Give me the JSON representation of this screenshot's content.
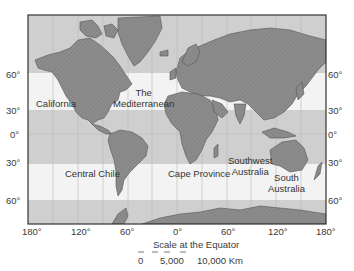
{
  "map": {
    "type": "world-map-equirectangular",
    "colors": {
      "land": "#8c8c8c",
      "land_hatch": "#7a7a7a",
      "shaded_band": "#cfcfcf",
      "highlight_band": "#f3f3f3",
      "border": "#333333",
      "graticule": "#b8b8b8"
    },
    "highlighted_bands": [
      "30°–60° N",
      "30°–60° S"
    ],
    "latitude_labels_left": [
      "60°",
      "30°",
      "0°",
      "30°",
      "60°"
    ],
    "latitude_labels_right": [
      "60°",
      "30°",
      "0°",
      "30°",
      "60°"
    ],
    "longitude_labels": [
      "180°",
      "120°",
      "60°",
      "0°",
      "60°",
      "120°",
      "180°"
    ],
    "regions": [
      {
        "id": "california",
        "lines": [
          "California"
        ]
      },
      {
        "id": "mediterranean",
        "lines": [
          "The",
          "Mediterranean"
        ]
      },
      {
        "id": "central-chile",
        "lines": [
          "Central Chile"
        ]
      },
      {
        "id": "cape-province",
        "lines": [
          "Cape Province"
        ]
      },
      {
        "id": "southwest-australia",
        "lines": [
          "Southwest",
          "Australia"
        ]
      },
      {
        "id": "south-australia",
        "lines": [
          "South",
          "Australia"
        ]
      }
    ],
    "scale": {
      "title": "Scale at the Equator",
      "ticks": [
        "0",
        "5,000",
        "10,000 Km"
      ]
    }
  }
}
